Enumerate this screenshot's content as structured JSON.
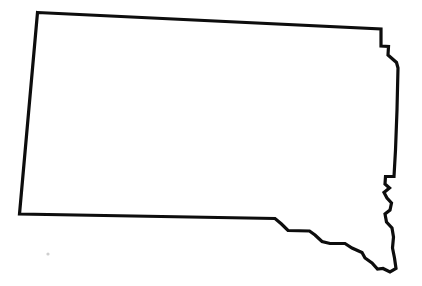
{
  "image": {
    "type": "outline-map",
    "subject": "South Dakota",
    "region": "United States",
    "width": 422,
    "height": 286,
    "background_color": "#ffffff",
    "outline_color": "#0d0d0d",
    "fill_color": "#ffffff",
    "stroke_width_px": 3.2,
    "labels": [],
    "text_visible": "none"
  },
  "map_data": {
    "shape_name": "south-dakota-state-boundary",
    "description": "Black outline silhouette of the state of South Dakota on a plain white background, no labels, no cities, no legend.",
    "border_segments": [
      {
        "name": "north-border",
        "kind": "straight-line",
        "note": "Nearly straight latitude line sloping slightly downward left to right"
      },
      {
        "name": "west-border",
        "kind": "straight-line",
        "note": "Nearly straight longitude line sloping slightly left going down"
      },
      {
        "name": "northeast-notch",
        "kind": "stepped",
        "note": "Small rectangular step and diagonal jog at the top right corner"
      },
      {
        "name": "east-border-big-sioux-river",
        "kind": "irregular",
        "note": "Vertical then wiggling river boundary with zigzag meanders in the lower third"
      },
      {
        "name": "south-border-missouri-river",
        "kind": "stepped-irregular",
        "note": "Straight west portion then descending steps and shallow dips following the Missouri River to the southeast tip"
      }
    ],
    "outline_path": "M 37.5 12.5 L 381.0 29.0 L 381.0 46.0 L 388.5 46.5 L 388.0 55.0 L 396.5 62.5 L 398.0 68.0 L 397.0 110.0 L 395.5 150.0 L 394.0 176.5 L 385.5 176.5 L 385.0 184.0 L 389.5 188.0 L 384.0 192.5 L 387.0 198.0 L 391.5 203.0 L 390.0 210.0 L 385.0 214.0 L 386.5 222.0 L 392.0 228.0 L 393.5 237.0 L 392.5 248.0 L 394.5 258.0 L 396.0 268.5 L 390.0 272.0 L 383.0 268.5 L 377.5 269.0 L 372.0 263.0 L 365.0 258.0 L 362.0 252.5 L 352.0 248.0 L 345.0 243.5 L 330.0 243.5 L 322.0 241.5 L 315.0 235.0 L 309.5 231.0 L 288.0 230.5 L 281.5 224.0 L 275.0 218.5 L 19.5 214.0 Z",
    "speck": {
      "name": "stray-speck",
      "x": 48,
      "y": 254,
      "r": 1.6,
      "color": "#cfcfcf"
    }
  }
}
